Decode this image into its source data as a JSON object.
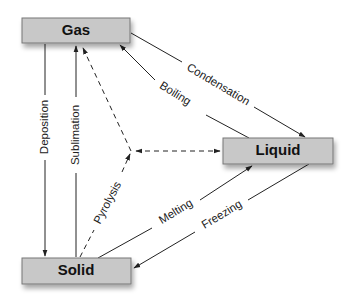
{
  "diagram": {
    "type": "phase-transition-diagram",
    "colors": {
      "box_fill": "#c8c8c8",
      "box_stroke": "#777777",
      "line": "#222222",
      "background": "#ffffff"
    },
    "nodes": {
      "gas": {
        "label": "Gas"
      },
      "liquid": {
        "label": "Liquid"
      },
      "solid": {
        "label": "Solid"
      }
    },
    "edges": {
      "condensation": {
        "label": "Condensation",
        "from": "Gas",
        "to": "Liquid",
        "style": "solid"
      },
      "boiling": {
        "label": "Boiling",
        "from": "Liquid",
        "to": "Gas",
        "style": "solid"
      },
      "deposition": {
        "label": "Deposition",
        "from": "Gas",
        "to": "Solid",
        "style": "solid"
      },
      "sublimation": {
        "label": "Sublimation",
        "from": "Solid",
        "to": "Gas",
        "style": "solid"
      },
      "melting": {
        "label": "Melting",
        "from": "Solid",
        "to": "Liquid",
        "style": "solid"
      },
      "freezing": {
        "label": "Freezing",
        "from": "Liquid",
        "to": "Solid",
        "style": "solid"
      },
      "pyrolysis": {
        "label": "Pyrolysis",
        "from": "Solid",
        "to": "Gas + Liquid",
        "style": "dashed"
      }
    }
  }
}
